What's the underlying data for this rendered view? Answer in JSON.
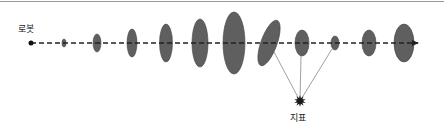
{
  "labels": {
    "robot": "로봇",
    "landmark": "지표"
  },
  "colors": {
    "ellipse_fill": "#5f5f5f",
    "ellipse_stroke": "#444444",
    "path": "#222222",
    "sight_line": "#888888",
    "landmark": "#1a1a1a",
    "top_rule": "#9a9a9a"
  },
  "icons": {
    "robot": "robot-position-dot-icon",
    "landmark": "landmark-star-icon",
    "arrow": "arrow-right-icon"
  },
  "diagram": {
    "path": {
      "y": 43,
      "x_start": 31,
      "x_end": 418
    },
    "robot": {
      "x": 31,
      "y": 43,
      "r": 2.5
    },
    "landmark": {
      "x": 300,
      "y": 101
    },
    "ellipses": [
      {
        "cx": 64,
        "rx": 2,
        "ry": 4,
        "rot": 0
      },
      {
        "cx": 97,
        "rx": 4,
        "ry": 9,
        "rot": 0
      },
      {
        "cx": 132,
        "rx": 5,
        "ry": 14,
        "rot": 0
      },
      {
        "cx": 166,
        "rx": 6.5,
        "ry": 19,
        "rot": 0
      },
      {
        "cx": 200,
        "rx": 8,
        "ry": 24,
        "rot": 0
      },
      {
        "cx": 234,
        "rx": 11,
        "ry": 31,
        "rot": 0
      },
      {
        "cx": 269,
        "rx": 8,
        "ry": 24,
        "rot": 20
      },
      {
        "cx": 302,
        "rx": 7,
        "ry": 13,
        "rot": 0
      },
      {
        "cx": 335,
        "rx": 4,
        "ry": 7,
        "rot": 0
      },
      {
        "cx": 369,
        "rx": 7,
        "ry": 13,
        "rot": 0
      },
      {
        "cx": 404,
        "rx": 10,
        "ry": 19,
        "rot": 0
      }
    ],
    "sight_lines": [
      {
        "x1": 274,
        "y1": 52
      },
      {
        "x1": 301,
        "y1": 56
      },
      {
        "x1": 332,
        "y1": 49
      }
    ]
  }
}
